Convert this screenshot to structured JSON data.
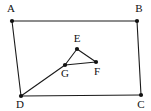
{
  "figure": {
    "background_color": "#ffffff",
    "stroke_color": "#1a1a1a",
    "label_color": "#111111",
    "canvas": {
      "width": 151,
      "height": 111
    },
    "points": {
      "A": {
        "label": "A",
        "x": 12,
        "y": 21,
        "label_x": 11,
        "label_y": 12
      },
      "B": {
        "label": "B",
        "x": 137,
        "y": 21,
        "label_x": 139,
        "label_y": 12
      },
      "C": {
        "label": "C",
        "x": 141,
        "y": 95,
        "label_x": 141,
        "label_y": 108
      },
      "D": {
        "label": "D",
        "x": 21,
        "y": 96,
        "label_x": 20,
        "label_y": 108
      },
      "E": {
        "label": "E",
        "x": 77,
        "y": 49,
        "label_x": 77,
        "label_y": 42
      },
      "F": {
        "label": "F",
        "x": 96,
        "y": 62,
        "label_x": 97,
        "label_y": 75
      },
      "G": {
        "label": "G",
        "x": 65,
        "y": 65,
        "label_x": 65,
        "label_y": 77
      }
    },
    "edges": [
      {
        "name": "edge-AB",
        "from": "A",
        "to": "B"
      },
      {
        "name": "edge-BC",
        "from": "B",
        "to": "C"
      },
      {
        "name": "edge-CD",
        "from": "C",
        "to": "D"
      },
      {
        "name": "edge-DA",
        "from": "D",
        "to": "A"
      },
      {
        "name": "edge-DG",
        "from": "D",
        "to": "G"
      },
      {
        "name": "edge-GE",
        "from": "G",
        "to": "E"
      },
      {
        "name": "edge-EF",
        "from": "E",
        "to": "F"
      },
      {
        "name": "edge-FG",
        "from": "F",
        "to": "G"
      }
    ],
    "vertex_order": [
      "A",
      "B",
      "C",
      "D",
      "E",
      "F",
      "G"
    ],
    "dot_radius": 2.1
  }
}
